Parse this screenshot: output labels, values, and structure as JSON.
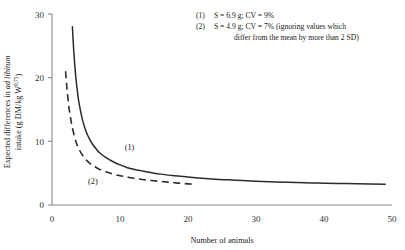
{
  "chart_data": {
    "type": "line",
    "title": "",
    "xlabel": "Number of animals",
    "ylabel_line1_prefix": "Expected differences in ",
    "ylabel_line1_italic": "ad libitum",
    "ylabel_line2_prefix": "intake (g DM/kg W",
    "ylabel_line2_sup": "0.75",
    "ylabel_line2_suffix": ")",
    "xlim": [
      0,
      50
    ],
    "ylim": [
      0,
      30
    ],
    "xticks": [
      "0",
      "10",
      "20",
      "30",
      "40",
      "50"
    ],
    "yticks": [
      "0",
      "10",
      "20",
      "30"
    ],
    "grid": false,
    "legend_position": "top-right-annotation",
    "series": [
      {
        "name": "(1)",
        "label": "(1)",
        "style": "solid",
        "color": "#2b2b2b",
        "S": 6.9,
        "CV": "9%",
        "x": [
          3,
          3.2,
          3.5,
          3.8,
          4,
          4.5,
          5,
          5.5,
          6,
          6.5,
          7,
          8,
          9,
          10,
          11,
          12,
          13,
          14,
          15,
          16,
          18,
          20,
          22,
          24,
          26,
          28,
          30,
          33,
          36,
          39,
          42,
          45,
          49
        ],
        "y": [
          28.0,
          24.2,
          20.1,
          17.3,
          15.9,
          13.3,
          11.6,
          10.4,
          9.5,
          8.8,
          8.2,
          7.4,
          6.8,
          6.3,
          5.9,
          5.6,
          5.4,
          5.2,
          5.0,
          4.85,
          4.6,
          4.4,
          4.2,
          4.05,
          3.95,
          3.85,
          3.75,
          3.62,
          3.52,
          3.45,
          3.38,
          3.32,
          3.25
        ]
      },
      {
        "name": "(2)",
        "label": "(2)",
        "style": "dashed",
        "color": "#2b2b2b",
        "S": 4.9,
        "CV": "7%",
        "x": [
          2,
          2.2,
          2.5,
          2.8,
          3,
          3.5,
          4,
          4.5,
          5,
          5.5,
          6,
          7,
          8,
          9,
          10,
          11,
          12,
          13,
          14,
          15,
          16,
          17,
          18,
          19,
          20,
          21
        ],
        "y": [
          21.0,
          18.3,
          15.3,
          13.2,
          12.1,
          10.0,
          8.7,
          7.8,
          7.1,
          6.6,
          6.2,
          5.6,
          5.2,
          4.85,
          4.6,
          4.4,
          4.2,
          4.05,
          3.9,
          3.8,
          3.7,
          3.6,
          3.5,
          3.4,
          3.32,
          3.25
        ]
      }
    ],
    "annotations": [
      {
        "id": "note-1",
        "marker": "(1)",
        "text": "S = 6.9 g; CV = 9%"
      },
      {
        "id": "note-2",
        "marker": "(2)",
        "text": "S = 4.9 g; CV = 7% (ignoring values which",
        "text_line2": "differ from the mean by more than 2 SD)"
      }
    ],
    "curve_tags": [
      {
        "label": "(1)",
        "x": 11.4,
        "y": 8.6
      },
      {
        "label": "(2)",
        "x": 6.0,
        "y": 3.3
      }
    ]
  },
  "style": {
    "axis_color": "#8a8a8a",
    "curve_color": "#2b2b2b",
    "background": "#ffffff"
  }
}
